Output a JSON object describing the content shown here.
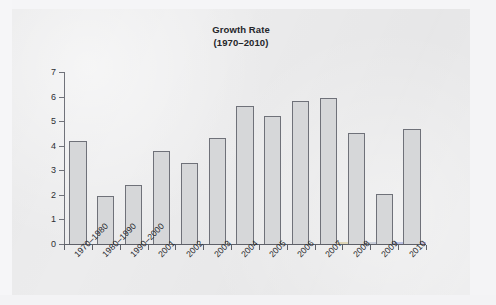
{
  "chart_data": {
    "type": "bar",
    "title": "Growth Rate",
    "subtitle": "(1970–2010)",
    "xlabel": "",
    "ylabel": "",
    "ylim": [
      0,
      7
    ],
    "yticks": [
      0,
      1,
      2,
      3,
      4,
      5,
      6,
      7
    ],
    "grid": false,
    "legend": null,
    "categories": [
      "1970–1980",
      "1980–1990",
      "1990–2000",
      "2001",
      "2002",
      "2003",
      "2004",
      "2005",
      "2006",
      "2007",
      "2008",
      "2009",
      "2010"
    ],
    "values": [
      4.2,
      1.95,
      2.4,
      3.8,
      3.3,
      4.3,
      5.6,
      5.2,
      5.8,
      5.95,
      4.5,
      2.05,
      4.7
    ],
    "bar_fill": "#d6d7d9",
    "bar_outline": "#6f7179",
    "axis_color": "#5e6068",
    "plot_background": "#e9e9eb"
  }
}
